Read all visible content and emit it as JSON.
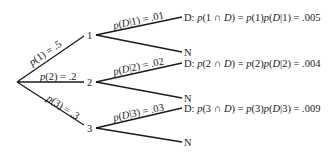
{
  "diagram": {
    "type": "probability-tree",
    "root": {
      "x": 17,
      "y": 82
    },
    "stages": [
      {
        "node": "1",
        "node_pos": {
          "x": 87,
          "y": 35
        },
        "branch_label": {
          "p": "p",
          "arg": "(1) = .5"
        },
        "cond_label": {
          "p": "p",
          "arg": "(",
          "D": "D",
          "rest": "|1) = .01"
        },
        "d_y": 17,
        "n_y": 52,
        "outcome_D": {
          "prefix": "D: ",
          "p1": "p",
          "a1": "(1 ∩ ",
          "D1": "D",
          "b1": ") = ",
          "p2": "p",
          "a2": "(1)",
          "p3": "p",
          "a3": "(",
          "D2": "D",
          "b3": "|1) = .005"
        },
        "outcome_N": "N"
      },
      {
        "node": "2",
        "node_pos": {
          "x": 87,
          "y": 82
        },
        "branch_label": {
          "p": "p",
          "arg": "(2) = .2"
        },
        "cond_label": {
          "p": "p",
          "arg": "(",
          "D": "D",
          "rest": "|2) = .02"
        },
        "d_y": 63,
        "n_y": 98,
        "outcome_D": {
          "prefix": "D: ",
          "p1": "p",
          "a1": "(2 ∩ ",
          "D1": "D",
          "b1": ") = ",
          "p2": "p",
          "a2": "(2)",
          "p3": "p",
          "a3": "(",
          "D2": "D",
          "b3": "|2) = .004"
        },
        "outcome_N": "N"
      },
      {
        "node": "3",
        "node_pos": {
          "x": 87,
          "y": 128
        },
        "branch_label": {
          "p": "p",
          "arg": "(3) = .3"
        },
        "cond_label": {
          "p": "p",
          "arg": "(",
          "D": "D",
          "rest": "|3) = .03"
        },
        "d_y": 108,
        "n_y": 142,
        "outcome_D": {
          "prefix": "D: ",
          "p1": "p",
          "a1": "(3 ∩ ",
          "D1": "D",
          "b1": ") = ",
          "p2": "p",
          "a2": "(3)",
          "p3": "p",
          "a3": "(",
          "D2": "D",
          "b3": "|3) = .009"
        },
        "outcome_N": "N"
      }
    ]
  }
}
